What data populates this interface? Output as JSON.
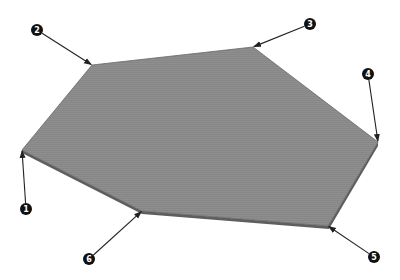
{
  "diagram": {
    "type": "polygon-face-vertices",
    "face_color": "#8c8c8c",
    "edge_color": "#555555",
    "thickness_color": "#6a6a6a",
    "callout_color": "#111111",
    "arrow_color": "#222222",
    "vertices": [
      {
        "id": "1",
        "label": "1",
        "x": 22,
        "y": 150,
        "lx": 26,
        "ly": 209
      },
      {
        "id": "2",
        "label": "2",
        "x": 92,
        "y": 65,
        "lx": 37,
        "ly": 30
      },
      {
        "id": "3",
        "label": "3",
        "x": 253,
        "y": 47,
        "lx": 310,
        "ly": 24
      },
      {
        "id": "4",
        "label": "4",
        "x": 378,
        "y": 142,
        "lx": 368,
        "ly": 74
      },
      {
        "id": "5",
        "label": "5",
        "x": 328,
        "y": 226,
        "lx": 374,
        "ly": 257
      },
      {
        "id": "6",
        "label": "6",
        "x": 142,
        "y": 211,
        "lx": 89,
        "ly": 259
      }
    ]
  }
}
